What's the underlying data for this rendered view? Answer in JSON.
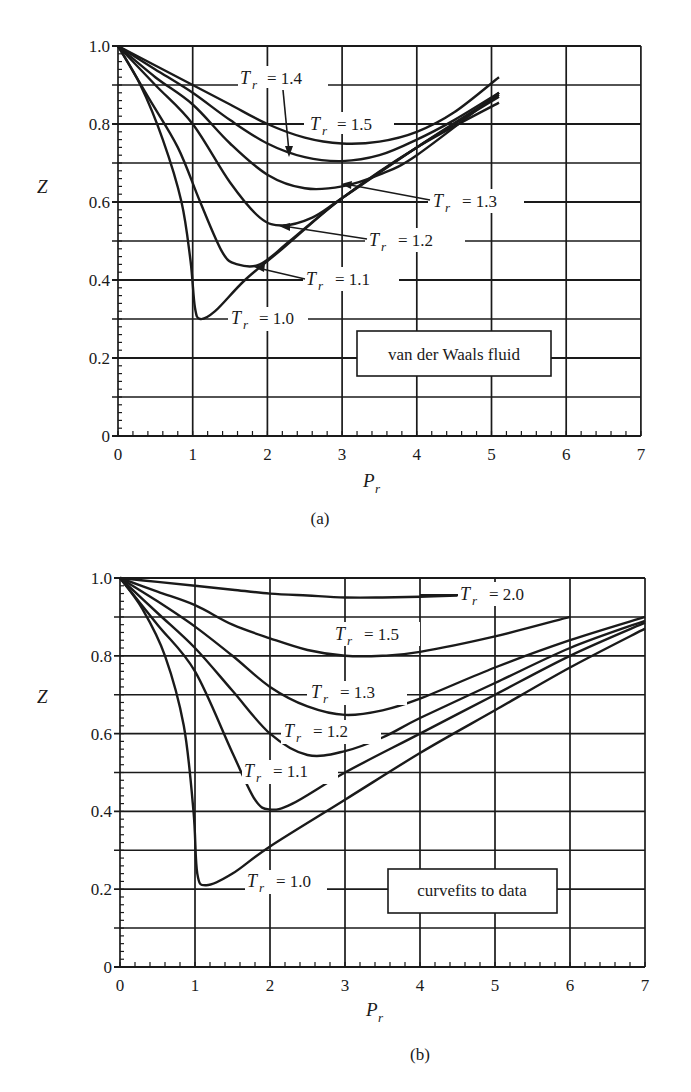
{
  "figure": {
    "panel_a_caption": "(a)",
    "panel_b_caption": "(b)"
  },
  "chart_data": [
    {
      "type": "line",
      "panel": "(a)",
      "title": "",
      "annotation": "van der Waals fluid",
      "xlabel": "P_r",
      "ylabel": "Z",
      "xlim": [
        0,
        7
      ],
      "ylim": [
        0,
        1.0
      ],
      "xticks": [
        "0",
        "1",
        "2",
        "3",
        "4",
        "5",
        "6",
        "7"
      ],
      "yticks": [
        "0",
        "0.2",
        "0.4",
        "0.6",
        "0.8",
        "1.0"
      ],
      "grid": true,
      "grid_minor_y": 0.1,
      "legend_position": "inline labels",
      "series": [
        {
          "name": "T_r = 1.0",
          "label": "= 1.0",
          "x": [
            0,
            0.3,
            0.6,
            0.85,
            0.97,
            1.03,
            1.1,
            1.3,
            1.7,
            2.2,
            3.0,
            4.0,
            5.1
          ],
          "values": [
            1.0,
            0.9,
            0.76,
            0.6,
            0.45,
            0.33,
            0.3,
            0.32,
            0.4,
            0.48,
            0.61,
            0.74,
            0.855
          ]
        },
        {
          "name": "T_r = 1.1",
          "label": "= 1.1",
          "x": [
            0,
            0.4,
            0.8,
            1.1,
            1.4,
            1.6,
            1.9,
            2.3,
            3.0,
            4.0,
            5.1
          ],
          "values": [
            1.0,
            0.87,
            0.74,
            0.6,
            0.47,
            0.44,
            0.44,
            0.5,
            0.61,
            0.74,
            0.87
          ]
        },
        {
          "name": "T_r = 1.2",
          "label": "= 1.2",
          "x": [
            0,
            0.5,
            1.0,
            1.5,
            1.9,
            2.2,
            2.6,
            3.0,
            4.0,
            5.1
          ],
          "values": [
            1.0,
            0.9,
            0.8,
            0.65,
            0.56,
            0.54,
            0.56,
            0.61,
            0.74,
            0.875
          ]
        },
        {
          "name": "T_r = 1.3",
          "label": "= 1.3",
          "x": [
            0,
            0.5,
            1.0,
            1.5,
            2.0,
            2.5,
            3.0,
            3.5,
            4.0,
            5.1
          ],
          "values": [
            1.0,
            0.92,
            0.85,
            0.75,
            0.67,
            0.635,
            0.64,
            0.67,
            0.72,
            0.88
          ]
        },
        {
          "name": "T_r = 1.4",
          "label": "= 1.4",
          "x": [
            0,
            0.5,
            1.0,
            1.5,
            2.0,
            2.5,
            3.0,
            3.5,
            4.0,
            4.5,
            5.1
          ],
          "values": [
            1.0,
            0.94,
            0.88,
            0.81,
            0.75,
            0.715,
            0.705,
            0.72,
            0.76,
            0.81,
            0.88
          ]
        },
        {
          "name": "T_r = 1.5",
          "label": "= 1.5",
          "x": [
            0,
            0.5,
            1.0,
            1.5,
            2.0,
            2.5,
            3.0,
            3.5,
            4.0,
            4.5,
            5.1
          ],
          "values": [
            1.0,
            0.95,
            0.9,
            0.85,
            0.8,
            0.765,
            0.75,
            0.755,
            0.78,
            0.83,
            0.92
          ]
        }
      ]
    },
    {
      "type": "line",
      "panel": "(b)",
      "title": "",
      "annotation": "curvefits to data",
      "xlabel": "P_r",
      "ylabel": "Z",
      "xlim": [
        0,
        7
      ],
      "ylim": [
        0,
        1.0
      ],
      "xticks": [
        "0",
        "1",
        "2",
        "3",
        "4",
        "5",
        "6",
        "7"
      ],
      "yticks": [
        "0",
        "0.2",
        "0.4",
        "0.6",
        "0.8",
        "1.0"
      ],
      "grid": true,
      "grid_minor_y": 0.1,
      "legend_position": "inline labels",
      "series": [
        {
          "name": "T_r = 1.0",
          "label": "= 1.0",
          "x": [
            0,
            0.3,
            0.6,
            0.85,
            0.98,
            1.03,
            1.15,
            1.5,
            2.0,
            3.0,
            4.0,
            5.0,
            6.0,
            7.0
          ],
          "values": [
            1.0,
            0.92,
            0.8,
            0.62,
            0.4,
            0.24,
            0.21,
            0.24,
            0.31,
            0.43,
            0.55,
            0.66,
            0.77,
            0.87
          ]
        },
        {
          "name": "T_r = 1.1",
          "label": "= 1.1",
          "x": [
            0,
            0.5,
            1.0,
            1.5,
            1.8,
            2.0,
            2.3,
            3.0,
            4.0,
            5.0,
            6.0,
            7.0
          ],
          "values": [
            1.0,
            0.88,
            0.76,
            0.55,
            0.43,
            0.405,
            0.42,
            0.5,
            0.6,
            0.7,
            0.8,
            0.885
          ]
        },
        {
          "name": "T_r = 1.2",
          "label": "= 1.2",
          "x": [
            0,
            0.5,
            1.0,
            1.5,
            2.0,
            2.5,
            3.0,
            3.5,
            4.0,
            5.0,
            6.0,
            7.0
          ],
          "values": [
            1.0,
            0.91,
            0.82,
            0.71,
            0.6,
            0.545,
            0.555,
            0.59,
            0.64,
            0.73,
            0.82,
            0.89
          ]
        },
        {
          "name": "T_r = 1.3",
          "label": "= 1.3",
          "x": [
            0,
            0.5,
            1.0,
            1.5,
            2.0,
            2.5,
            3.0,
            3.5,
            4.0,
            5.0,
            6.0,
            7.0
          ],
          "values": [
            1.0,
            0.94,
            0.875,
            0.8,
            0.72,
            0.67,
            0.648,
            0.66,
            0.69,
            0.77,
            0.84,
            0.9
          ]
        },
        {
          "name": "T_r = 1.5",
          "label": "= 1.5",
          "x": [
            0,
            0.5,
            1.0,
            1.5,
            2.0,
            2.5,
            3.0,
            3.5,
            4.0,
            5.0,
            6.0
          ],
          "values": [
            1.0,
            0.965,
            0.93,
            0.88,
            0.845,
            0.815,
            0.8,
            0.8,
            0.81,
            0.85,
            0.9
          ]
        },
        {
          "name": "T_r = 2.0",
          "label": "= 2.0",
          "x": [
            0,
            0.5,
            1.0,
            1.5,
            2.0,
            2.5,
            3.0,
            3.5,
            4.0,
            4.5
          ],
          "values": [
            1.0,
            0.99,
            0.98,
            0.97,
            0.96,
            0.955,
            0.95,
            0.95,
            0.952,
            0.955
          ]
        }
      ]
    }
  ],
  "labels": {
    "a": {
      "z_axis": "Z",
      "p_axis": "P",
      "p_sub": "r",
      "t_symbol": "T",
      "t_sub": "r",
      "box": "van der Waals fluid",
      "tr14": "= 1.4",
      "tr15": "= 1.5",
      "tr13": "= 1.3",
      "tr12": "= 1.2",
      "tr11": "= 1.1",
      "tr10": "= 1.0"
    },
    "b": {
      "z_axis": "Z",
      "p_axis": "P",
      "p_sub": "r",
      "t_symbol": "T",
      "t_sub": "r",
      "box": "curvefits to data",
      "tr20": "= 2.0",
      "tr15": "= 1.5",
      "tr13": "= 1.3",
      "tr12": "= 1.2",
      "tr11": "= 1.1",
      "tr10": "= 1.0"
    }
  }
}
